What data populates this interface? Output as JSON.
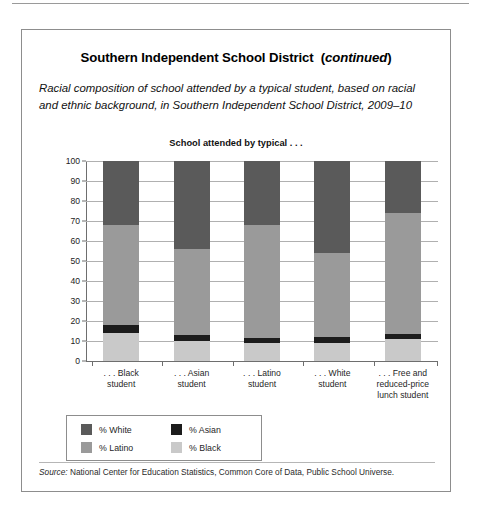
{
  "panel": {
    "title_main": "Southern Independent School District",
    "title_continued": "(continued)",
    "title_full": "Southern Independent School District (continued)",
    "subtitle": "Racial composition of school attended by a typical student, based on racial and ethnic background, in Southern Independent School District, 2009–10",
    "source_label": "Source:",
    "source_text": " National Center for Education Statistics, Common Core of Data, Public School Universe."
  },
  "chart_data": {
    "type": "bar",
    "subtype": "stacked-column-100",
    "title": "School attended by typical . . .",
    "xlabel": "",
    "ylabel": "",
    "ylim": [
      0,
      100
    ],
    "yticks": [
      0,
      10,
      20,
      30,
      40,
      50,
      60,
      70,
      80,
      90,
      100
    ],
    "ytick_labels": [
      "0",
      "10",
      "20",
      "30",
      "40",
      "50",
      "60",
      "70",
      "80",
      "90",
      "100"
    ],
    "grid": true,
    "legend_position": "below-left",
    "categories": [
      ". . . Black student",
      ". . . Asian student",
      ". . . Latino student",
      ". . . White student",
      ". . . Free and reduced-price lunch student"
    ],
    "category_lines": [
      [
        ". . . Black",
        "student"
      ],
      [
        ". . . Asian",
        "student"
      ],
      [
        ". . . Latino",
        "student"
      ],
      [
        ". . . White",
        "student"
      ],
      [
        ". . . Free and",
        "reduced-price",
        "lunch student"
      ]
    ],
    "series": [
      {
        "name": "% Black",
        "color": "#c9c9c9",
        "values": [
          14,
          10,
          9,
          9,
          11
        ]
      },
      {
        "name": "% Asian",
        "color": "#1c1c1c",
        "values": [
          4,
          3,
          2.5,
          3,
          2.5
        ]
      },
      {
        "name": "% Latino",
        "color": "#9a9a9a",
        "values": [
          50,
          43,
          56.5,
          42,
          60.5
        ]
      },
      {
        "name": "% White",
        "color": "#5a5a5a",
        "values": [
          32,
          44,
          32,
          46,
          26
        ]
      }
    ],
    "stack_order_bottom_to_top": [
      "% Black",
      "% Asian",
      "% Latino",
      "% White"
    ],
    "legend": [
      {
        "label": "% White",
        "color": "#5a5a5a"
      },
      {
        "label": "% Asian",
        "color": "#1c1c1c"
      },
      {
        "label": "% Latino",
        "color": "#9a9a9a"
      },
      {
        "label": "% Black",
        "color": "#c9c9c9"
      }
    ]
  }
}
